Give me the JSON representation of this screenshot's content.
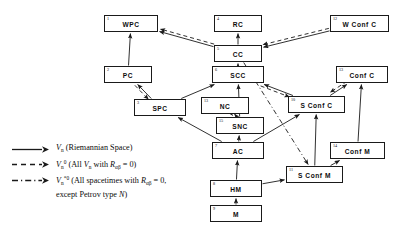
{
  "diagram": {
    "nodes": [
      {
        "id": "wpc",
        "num": "1",
        "label": "WPC",
        "x": 104,
        "y": 15,
        "w": 54,
        "h": 17
      },
      {
        "id": "rc",
        "num": "4",
        "label": "RC",
        "x": 214,
        "y": 15,
        "w": 48,
        "h": 17
      },
      {
        "id": "wconfc",
        "num": "12",
        "label": "W Conf C",
        "x": 330,
        "y": 15,
        "w": 59,
        "h": 17
      },
      {
        "id": "cc",
        "num": "5",
        "label": "CC",
        "x": 214,
        "y": 45,
        "w": 48,
        "h": 17
      },
      {
        "id": "pc",
        "num": "2",
        "label": "PC",
        "x": 104,
        "y": 66,
        "w": 48,
        "h": 17
      },
      {
        "id": "scc",
        "num": "6",
        "label": "SCC",
        "x": 212,
        "y": 66,
        "w": 52,
        "h": 17
      },
      {
        "id": "confc",
        "num": "13",
        "label": "Conf C",
        "x": 336,
        "y": 66,
        "w": 52,
        "h": 17
      },
      {
        "id": "spc",
        "num": "3",
        "label": "SPC",
        "x": 134,
        "y": 99,
        "w": 52,
        "h": 17
      },
      {
        "id": "nc",
        "num": "13",
        "label": "NC",
        "x": 201,
        "y": 97,
        "w": 48,
        "h": 17
      },
      {
        "id": "sconfc",
        "num": "10",
        "label": "S Conf C",
        "x": 288,
        "y": 96,
        "w": 57,
        "h": 17
      },
      {
        "id": "snc",
        "num": "15",
        "label": "SNC",
        "x": 216,
        "y": 117,
        "w": 48,
        "h": 17
      },
      {
        "id": "ac",
        "num": "7",
        "label": "AC",
        "x": 212,
        "y": 142,
        "w": 52,
        "h": 17
      },
      {
        "id": "confm",
        "num": "14",
        "label": "Conf M",
        "x": 330,
        "y": 142,
        "w": 55,
        "h": 17
      },
      {
        "id": "sconfm",
        "num": "11",
        "label": "S Conf M",
        "x": 286,
        "y": 166,
        "w": 57,
        "h": 17
      },
      {
        "id": "hm",
        "num": "8",
        "label": "HM",
        "x": 210,
        "y": 180,
        "w": 52,
        "h": 17
      },
      {
        "id": "m",
        "num": "9",
        "label": "M",
        "x": 210,
        "y": 205,
        "w": 52,
        "h": 17
      }
    ],
    "edges": [
      {
        "from": "pc",
        "to": "wpc",
        "style": "solid"
      },
      {
        "from": "cc",
        "to": "wpc",
        "style": "solid"
      },
      {
        "from": "cc",
        "to": "wpc",
        "style": "dashed"
      },
      {
        "from": "cc",
        "to": "rc",
        "style": "solid"
      },
      {
        "from": "wconfc",
        "to": "cc",
        "style": "solid"
      },
      {
        "from": "wconfc",
        "to": "cc",
        "style": "dashed"
      },
      {
        "from": "scc",
        "to": "cc",
        "style": "solid"
      },
      {
        "from": "spc",
        "to": "pc",
        "style": "solid"
      },
      {
        "from": "pc",
        "to": "spc",
        "style": "dashed"
      },
      {
        "from": "spc",
        "to": "scc",
        "style": "solid"
      },
      {
        "from": "ac",
        "to": "spc",
        "style": "solid"
      },
      {
        "from": "snc",
        "to": "scc",
        "style": "solid"
      },
      {
        "from": "nc",
        "to": "snc",
        "style": "solid"
      },
      {
        "from": "snc",
        "to": "nc",
        "style": "solid"
      },
      {
        "from": "ac",
        "to": "snc",
        "style": "solid"
      },
      {
        "from": "sconfc",
        "to": "scc",
        "style": "solid"
      },
      {
        "from": "scc",
        "to": "sconfc",
        "style": "dashed"
      },
      {
        "from": "sconfc",
        "to": "confc",
        "style": "solid"
      },
      {
        "from": "confc",
        "to": "sconfc",
        "style": "dashed"
      },
      {
        "from": "confm",
        "to": "confc",
        "style": "solid"
      },
      {
        "from": "sconfm",
        "to": "sconfc",
        "style": "solid"
      },
      {
        "from": "cc",
        "to": "sconfm",
        "style": "dashdot"
      },
      {
        "from": "ac",
        "to": "sconfc",
        "style": "solid"
      },
      {
        "from": "hm",
        "to": "ac",
        "style": "solid"
      },
      {
        "from": "m",
        "to": "hm",
        "style": "solid"
      },
      {
        "from": "hm",
        "to": "sconfm",
        "style": "solid"
      },
      {
        "from": "sconfm",
        "to": "confm",
        "style": "solid"
      }
    ]
  },
  "legend": {
    "items": [
      {
        "id": "solid",
        "style": "solid",
        "symbol_html": "<i class=\"v\">V</i><sub class=\"s\">n</sub>",
        "text": " (Riemannian Space)",
        "plain": "Vn (Riemannian Space)"
      },
      {
        "id": "dashed",
        "style": "dashed",
        "symbol_html": "<i class=\"v\">V</i><sub class=\"s\">n</sub><sup class=\"s\">0</sup>",
        "text": " (All <i class=\"v\">V</i><sub class=\"s\">n</sub> with <i class=\"v\">R</i><sub class=\"s\">&#945;&#946;</sub> = 0)",
        "plain": "Vn0 (All Vn with Rab = 0)"
      },
      {
        "id": "dashdot",
        "style": "dashdot",
        "symbol_html": "<i class=\"v\">V</i><sub class=\"s\">n</sub><sup class=\"s\">*0</sup>",
        "text": " (All spacetimes with <i class=\"v\">R</i><sub class=\"s\">&#945;&#946;</sub> = 0,<br>except Petrov type <i class=\"v\">N</i>)",
        "plain": "Vn*0 (All spacetimes with Rab = 0, except Petrov type N)"
      }
    ]
  },
  "colors": {
    "line": "#1a1a1a",
    "text": "#000000",
    "background": "#ffffff"
  }
}
